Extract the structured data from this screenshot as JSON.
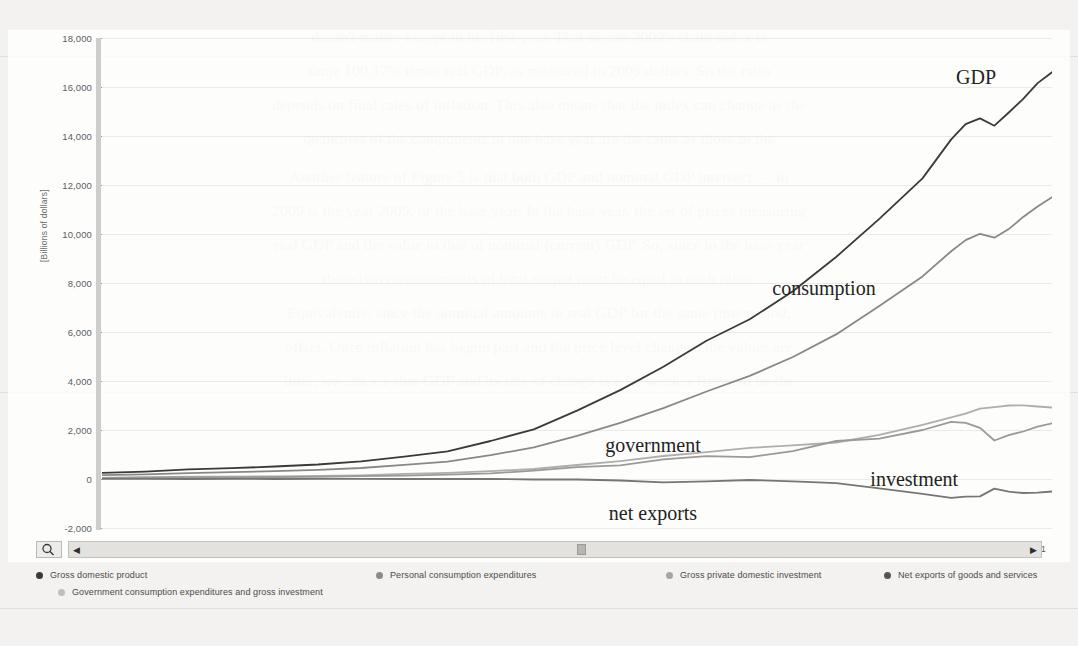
{
  "chart_data": {
    "type": "line",
    "title": "",
    "xlabel": "",
    "ylabel": "[Billions of dollars]",
    "ylim": [
      -2000,
      18000
    ],
    "ytick_values": [
      18000,
      16000,
      14000,
      12000,
      10000,
      8000,
      6000,
      4000,
      2000,
      0,
      -2000
    ],
    "ytick_labels": [
      "18,000",
      "16,000",
      "14,000",
      "12,000",
      "10,000",
      "8,000",
      "6,000",
      "4,000",
      "2,000",
      "0",
      "-2,000"
    ],
    "grid": true,
    "legend_position": "bottom",
    "xtick_labels": [
      "1947-Q1",
      "1950-Q2",
      "1953-Q3",
      "1956-Q4",
      "1960-Q1",
      "1963-Q2",
      "1966-Q3",
      "1969-Q4",
      "1973-Q1",
      "1976-Q2",
      "1979-Q3",
      "1982-Q4",
      "1986-Q1",
      "1989-Q2",
      "1992-Q3",
      "1995-Q4",
      "1999-Q1",
      "2002-Q2",
      "2005-Q3",
      "2008-Q4",
      "2012-Q1"
    ],
    "x": [
      1947,
      1950,
      1953,
      1956,
      1959,
      1962,
      1965,
      1968,
      1971,
      1974,
      1977,
      1980,
      1983,
      1986,
      1989,
      1992,
      1995,
      1998,
      2001,
      2004,
      2006,
      2007,
      2008,
      2009,
      2010,
      2011,
      2012,
      2013
    ],
    "series": [
      {
        "name": "Gross domestic product",
        "label": "GDP",
        "color": "#3a3a3a",
        "values": [
          250,
          300,
          390,
          440,
          510,
          590,
          720,
          910,
          1130,
          1550,
          2030,
          2790,
          3630,
          4580,
          5640,
          6520,
          7660,
          9060,
          10620,
          12270,
          13860,
          14480,
          14720,
          14420,
          14960,
          15520,
          16160,
          16600
        ]
      },
      {
        "name": "Personal consumption expenditures",
        "label": "consumption",
        "color": "#888888",
        "values": [
          160,
          190,
          240,
          280,
          320,
          370,
          450,
          580,
          710,
          970,
          1290,
          1760,
          2290,
          2890,
          3570,
          4210,
          4980,
          5900,
          7060,
          8270,
          9300,
          9750,
          10010,
          9850,
          10200,
          10700,
          11120,
          11500
        ]
      },
      {
        "name": "Government consumption expenditures and gross investment",
        "label": "government",
        "color": "#b0aeaa",
        "values": [
          40,
          60,
          100,
          100,
          110,
          130,
          150,
          210,
          250,
          320,
          410,
          570,
          730,
          940,
          1100,
          1270,
          1370,
          1490,
          1800,
          2210,
          2520,
          2670,
          2870,
          2930,
          3000,
          3010,
          2960,
          2920
        ]
      },
      {
        "name": "Gross private domestic investment",
        "label": "investment",
        "color": "#9c9a96",
        "values": [
          40,
          60,
          60,
          75,
          80,
          90,
          120,
          140,
          180,
          230,
          340,
          480,
          560,
          800,
          930,
          890,
          1140,
          1550,
          1650,
          2000,
          2330,
          2290,
          2090,
          1570,
          1790,
          1940,
          2140,
          2270
        ]
      },
      {
        "name": "Net exports of goods and services",
        "label": "net exports",
        "color": "#767676",
        "values": [
          10,
          5,
          -2,
          5,
          0,
          5,
          7,
          1,
          -2,
          0,
          -20,
          -20,
          -60,
          -140,
          -95,
          -40,
          -100,
          -170,
          -380,
          -610,
          -770,
          -720,
          -710,
          -390,
          -520,
          -570,
          -560,
          -510
        ]
      }
    ],
    "annotations": [
      {
        "text": "GDP",
        "x_pct": 92.0,
        "y_pct": 8.0
      },
      {
        "text": "consumption",
        "x_pct": 76.0,
        "y_pct": 51.0
      },
      {
        "text": "government",
        "x_pct": 58.0,
        "y_pct": 83.0
      },
      {
        "text": "investment",
        "x_pct": 85.5,
        "y_pct": 90.0
      },
      {
        "text": "net exports",
        "x_pct": 58.0,
        "y_pct": 97.0
      }
    ]
  },
  "controls": {
    "zoom_icon": "magnifier-icon",
    "scroll_left_arrow": "◀",
    "scroll_right_arrow": "▶"
  },
  "legend": {
    "items": [
      {
        "label": "Gross domestic product",
        "color": "#3a3a3a"
      },
      {
        "label": "Personal consumption expenditures",
        "color": "#8d8b87"
      },
      {
        "label": "Gross private domestic investment",
        "color": "#a7a5a1"
      },
      {
        "label": "Net exports of goods and services",
        "color": "#545454"
      },
      {
        "label": "Government consumption expenditures and gross investment",
        "color": "#c0bebb"
      }
    ]
  },
  "page_background": {
    "lines": [
      "doesn't matter except in his first year. That means 2009's chain index is",
      "same 100.17% times real GDP, as measured in 2009 dollars. So the ratio",
      "depends on final rates of inflation. This also means that the index can change as the",
      "quantities of the components in one base year are the same as those in the",
      "Another feature of Figure 5 is that both GDP and nominal GDP intersect — in",
      "2009 is the year 2009, or the base year. In the base year, the set of prices measuring",
      "real GDP and the value to that of nominal (current) GDP. So, since in the base year",
      "these two measurements of total output must be equal to each other.",
      "Equivalently, since the nominal amounts in real GDP for the same time period,",
      "offset. Once inflation has begun past and the price level changes, the values are",
      "little, we can see that GDP and its rate of change is a far weaker figure to be the"
    ]
  }
}
